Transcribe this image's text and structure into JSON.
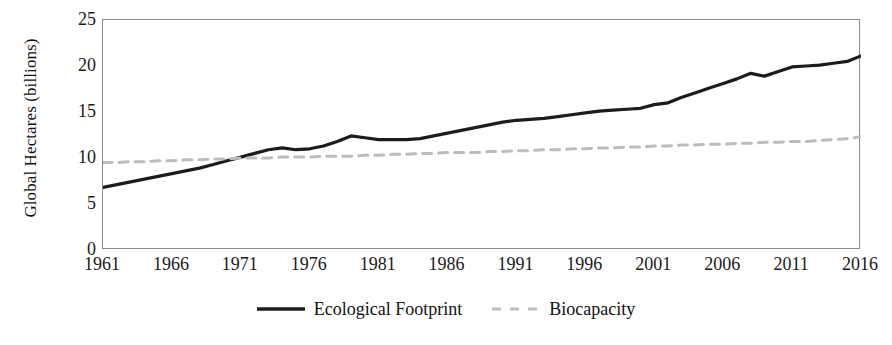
{
  "chart_data": {
    "type": "line",
    "title": "",
    "xlabel": "",
    "ylabel": "Global Hectares (billions)",
    "xlim": [
      1961,
      2016
    ],
    "ylim": [
      0,
      25
    ],
    "yticks": [
      25,
      20,
      15,
      10,
      5,
      0
    ],
    "xticks": [
      1961,
      1966,
      1971,
      1976,
      1981,
      1986,
      1991,
      1996,
      2001,
      2006,
      2011,
      2016
    ],
    "grid": false,
    "legend_position": "bottom-center",
    "x": [
      1961,
      1962,
      1963,
      1964,
      1965,
      1966,
      1967,
      1968,
      1969,
      1970,
      1971,
      1972,
      1973,
      1974,
      1975,
      1976,
      1977,
      1978,
      1979,
      1980,
      1981,
      1982,
      1983,
      1984,
      1985,
      1986,
      1987,
      1988,
      1989,
      1990,
      1991,
      1992,
      1993,
      1994,
      1995,
      1996,
      1997,
      1998,
      1999,
      2000,
      2001,
      2002,
      2003,
      2004,
      2005,
      2006,
      2007,
      2008,
      2009,
      2010,
      2011,
      2012,
      2013,
      2014,
      2015,
      2016
    ],
    "series": [
      {
        "name": "Ecological Footprint",
        "color": "#1c1c1c",
        "style": "solid",
        "values": [
          6.8,
          7.1,
          7.4,
          7.7,
          8.0,
          8.3,
          8.6,
          8.9,
          9.3,
          9.7,
          10.1,
          10.5,
          10.9,
          11.1,
          10.9,
          11.0,
          11.3,
          11.8,
          12.4,
          12.2,
          12.0,
          12.0,
          12.0,
          12.1,
          12.4,
          12.7,
          13.0,
          13.3,
          13.6,
          13.9,
          14.1,
          14.2,
          14.3,
          14.5,
          14.7,
          14.9,
          15.1,
          15.2,
          15.3,
          15.4,
          15.8,
          16.0,
          16.6,
          17.1,
          17.6,
          18.1,
          18.6,
          19.2,
          18.9,
          19.4,
          19.9,
          20.0,
          20.1,
          20.3,
          20.5,
          21.1
        ]
      },
      {
        "name": "Biocapacity",
        "color": "#bdbdbd",
        "style": "dashed",
        "values": [
          9.5,
          9.5,
          9.6,
          9.6,
          9.7,
          9.7,
          9.8,
          9.8,
          9.9,
          9.9,
          10.0,
          10.0,
          10.0,
          10.1,
          10.1,
          10.1,
          10.2,
          10.2,
          10.2,
          10.3,
          10.3,
          10.4,
          10.4,
          10.5,
          10.5,
          10.6,
          10.6,
          10.6,
          10.7,
          10.7,
          10.8,
          10.8,
          10.9,
          10.9,
          11.0,
          11.0,
          11.1,
          11.1,
          11.2,
          11.2,
          11.3,
          11.3,
          11.4,
          11.4,
          11.5,
          11.5,
          11.6,
          11.6,
          11.7,
          11.7,
          11.8,
          11.8,
          11.9,
          12.0,
          12.1,
          12.3
        ]
      }
    ],
    "legend": [
      {
        "label": "Ecological Footprint",
        "color": "#1c1c1c",
        "style": "solid"
      },
      {
        "label": "Biocapacity",
        "color": "#bdbdbd",
        "style": "dashed"
      }
    ]
  }
}
